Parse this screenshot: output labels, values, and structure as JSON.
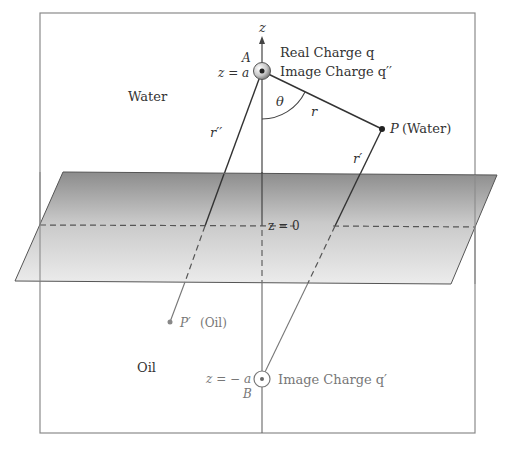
{
  "diagram": {
    "axis_label": "z",
    "regions": {
      "upper": "Water",
      "lower": "Oil"
    },
    "interface_label": "z = 0",
    "charge_A": {
      "point_label": "A",
      "position_label": "z = a",
      "line1": "Real Charge q",
      "line2": "Image Charge q′′"
    },
    "charge_B": {
      "point_label": "B",
      "position_label": "z = − a",
      "caption": "Image Charge q′"
    },
    "point_P": {
      "symbol": "P",
      "medium": "(Water)"
    },
    "point_P_prime": {
      "symbol": "P′",
      "medium": "(Oil)"
    },
    "distances": {
      "r": "r",
      "r_prime": "r′",
      "r_double_prime": "r′′"
    },
    "angle": "θ",
    "colors": {
      "frame": "#8a8a8a",
      "line": "#333333",
      "plane_top": "#8c8c8c",
      "plane_bottom": "#ebebeb"
    }
  }
}
